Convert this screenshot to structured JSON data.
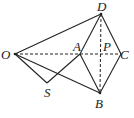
{
  "diagram": {
    "points": {
      "O": {
        "label": "O",
        "x": 15,
        "y": 54
      },
      "A": {
        "label": "A",
        "x": 80,
        "y": 54
      },
      "P": {
        "label": "P",
        "x": 101,
        "y": 54
      },
      "C": {
        "label": "C",
        "x": 121,
        "y": 54
      },
      "D": {
        "label": "D",
        "x": 101,
        "y": 14
      },
      "B": {
        "label": "B",
        "x": 100,
        "y": 93
      },
      "S": {
        "label": "S",
        "x": 47,
        "y": 83
      }
    },
    "solid_segments": [
      "OD",
      "OB",
      "OS",
      "SA",
      "AD",
      "AB",
      "DC",
      "CB"
    ],
    "dashed_segments": [
      "OC",
      "DB"
    ]
  }
}
